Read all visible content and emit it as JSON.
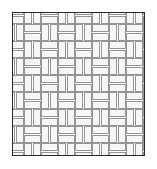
{
  "figure": {
    "kind": "geometric-pattern",
    "canvas": {
      "width": 157,
      "height": 169
    },
    "background_color": "#ffffff"
  },
  "frame": {
    "name": "outer-border",
    "x": 12,
    "y": 12,
    "width": 133,
    "height": 144,
    "stroke_color": "#2b2b2b",
    "stroke_width": 1.6,
    "fill_color": "#ffffff"
  },
  "pattern": {
    "name": "basketweave",
    "description": "Pairs of parallel rectangular tiles alternating between horizontal and vertical orientation on a checkerboard grid.",
    "unit_cell": 17,
    "tile_long": 16,
    "tile_short": 7,
    "tile_gap": 2,
    "columns": 9,
    "rows": 10,
    "origin_x": 11,
    "origin_y": 11,
    "tile_fill": "#f7f7f7",
    "tile_stroke": "#8a8a8a",
    "tile_stroke_width": 0.9,
    "grout_color": "#ffffff"
  }
}
